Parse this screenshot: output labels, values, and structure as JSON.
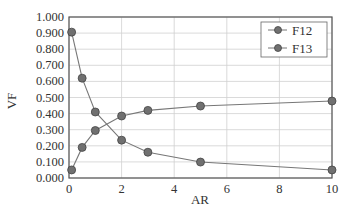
{
  "chart_data": {
    "type": "line",
    "title": "",
    "xlabel": "AR",
    "ylabel": "VF",
    "xlim": [
      0,
      10
    ],
    "ylim": [
      0,
      1
    ],
    "xticks": [
      0,
      2,
      4,
      6,
      8,
      10
    ],
    "xtick_labels": [
      "0",
      "2",
      "4",
      "6",
      "8",
      "10"
    ],
    "yticks": [
      0,
      0.1,
      0.2,
      0.3,
      0.4,
      0.5,
      0.6,
      0.7,
      0.8,
      0.9,
      1.0
    ],
    "ytick_labels": [
      "0.000",
      "0.100",
      "0.200",
      "0.300",
      "0.400",
      "0.500",
      "0.600",
      "0.700",
      "0.800",
      "0.900",
      "1.000"
    ],
    "grid": true,
    "legend_position": "upper right",
    "x": [
      0.1,
      0.5,
      1,
      2,
      3,
      5,
      10
    ],
    "series": [
      {
        "name": "F12",
        "values": [
          0.05,
          0.19,
          0.295,
          0.385,
          0.42,
          0.447,
          0.478
        ]
      },
      {
        "name": "F13",
        "values": [
          0.906,
          0.62,
          0.41,
          0.235,
          0.16,
          0.099,
          0.05
        ]
      }
    ]
  },
  "colors": {
    "line": "#777777",
    "marker": "#707070",
    "marker_edge": "#444444",
    "grid": "#d0d0d0",
    "axis": "#555555"
  }
}
